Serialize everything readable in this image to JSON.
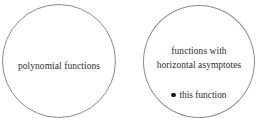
{
  "diagram": {
    "type": "venn-style-set-diagram",
    "background_color": "#ffffff",
    "outline_color": "#8c8c8c",
    "text_color": "#2b2b2b",
    "sets": [
      {
        "id": "polynomial",
        "label": "polynomial functions",
        "members": []
      },
      {
        "id": "horizontal-asymptotes",
        "label_line_1": "functions with",
        "label_line_2": "horizontal  asymptotes",
        "members": [
          {
            "bullet": "●",
            "bullet_name": "filled-circle-bullet",
            "label": "this function"
          }
        ]
      }
    ]
  }
}
